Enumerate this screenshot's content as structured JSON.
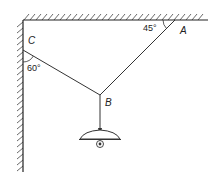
{
  "diagram": {
    "points": {
      "A": {
        "label": "A",
        "x": 175,
        "y": 20
      },
      "B": {
        "label": "B",
        "x": 100,
        "y": 95
      },
      "C": {
        "label": "C",
        "x": 23,
        "y": 50
      }
    },
    "angles": {
      "at_A": "45°",
      "at_C": "60°"
    },
    "colors": {
      "stroke": "#333333",
      "background": "#ffffff"
    }
  }
}
